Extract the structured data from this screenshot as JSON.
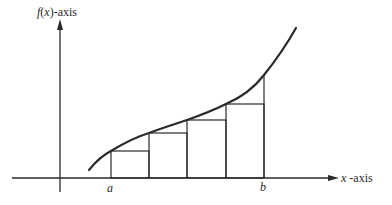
{
  "diagram": {
    "y_axis": {
      "label_fn": "f",
      "label_var": "x",
      "label_suffix": "-axis"
    },
    "x_axis": {
      "label_var": "x",
      "label_suffix": " -axis"
    },
    "interval": {
      "start_label": "a",
      "end_label": "b"
    },
    "rectangles": {
      "count": 4,
      "type": "left-endpoint / inscribed"
    },
    "colors": {
      "stroke": "#2a2a2a",
      "background": "#ffffff"
    }
  }
}
